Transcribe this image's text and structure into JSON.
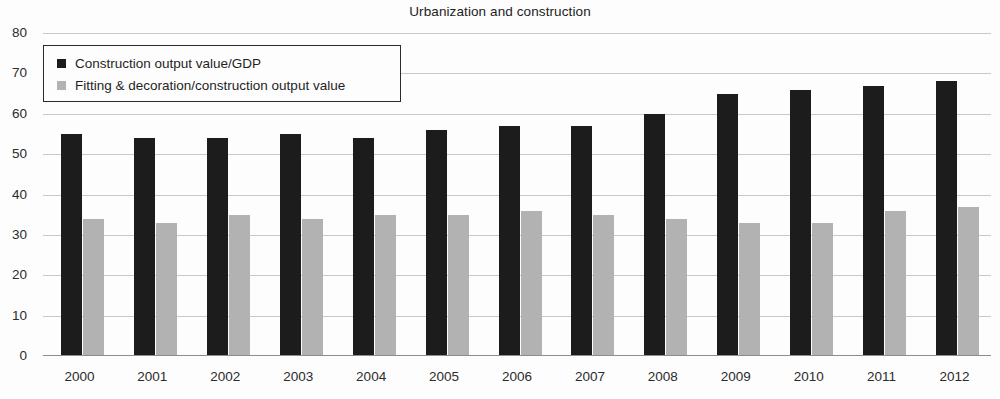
{
  "chart_data": {
    "type": "bar",
    "title": "Urbanization and construction",
    "xlabel": "",
    "ylabel": "",
    "ylim": [
      0,
      80
    ],
    "yticks": [
      0,
      10,
      20,
      30,
      40,
      50,
      60,
      70,
      80
    ],
    "grid": true,
    "legend_position": "top-left",
    "categories": [
      "2000",
      "2001",
      "2002",
      "2003",
      "2004",
      "2005",
      "2006",
      "2007",
      "2008",
      "2009",
      "2010",
      "2011",
      "2012"
    ],
    "series": [
      {
        "name": "Construction output value/GDP",
        "color": "#1c1c1c",
        "values": [
          55,
          54,
          54,
          55,
          54,
          56,
          57,
          57,
          60,
          65,
          66,
          67,
          68
        ]
      },
      {
        "name": "Fitting & decoration/construction output value",
        "color": "#b2b2b2",
        "values": [
          34,
          33,
          35,
          34,
          35,
          35,
          36,
          35,
          34,
          33,
          33,
          36,
          37
        ]
      }
    ]
  }
}
